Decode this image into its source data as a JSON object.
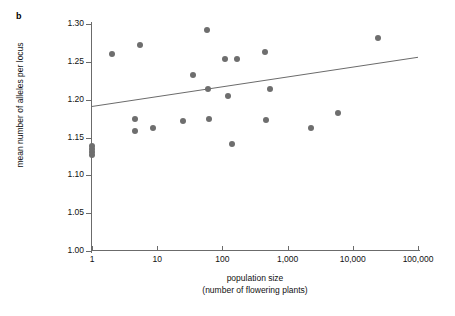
{
  "panel": {
    "label": "b"
  },
  "chart_data": {
    "type": "scatter",
    "title": "",
    "xlabel": "population size",
    "xlabel_line2": "(number of flowering plants)",
    "ylabel": "mean number of alleles per locus",
    "xscale": "log",
    "xlim": [
      1,
      100000
    ],
    "ylim": [
      1.0,
      1.3
    ],
    "grid": false,
    "legend": null,
    "xticks": [
      1,
      10,
      100,
      1000,
      10000,
      100000
    ],
    "xtick_labels": [
      "1",
      "10",
      "100",
      "1,000",
      "10,000",
      "100,000"
    ],
    "yticks": [
      1.0,
      1.05,
      1.1,
      1.15,
      1.2,
      1.25,
      1.3
    ],
    "ytick_labels": [
      "1.00",
      "1.05",
      "1.10",
      "1.15",
      "1.20",
      "1.25",
      "1.30"
    ],
    "point_color": "#6e6e6e",
    "line_color": "#6b6b6b",
    "axis_color": "#6b6b6b",
    "points": [
      {
        "x": 1,
        "y": 1.139
      },
      {
        "x": 1,
        "y": 1.135
      },
      {
        "x": 1,
        "y": 1.131
      },
      {
        "x": 1,
        "y": 1.127
      },
      {
        "x": 2,
        "y": 1.261
      },
      {
        "x": 4.5,
        "y": 1.174
      },
      {
        "x": 4.6,
        "y": 1.159
      },
      {
        "x": 5.5,
        "y": 1.272
      },
      {
        "x": 8.5,
        "y": 1.162
      },
      {
        "x": 25,
        "y": 1.172
      },
      {
        "x": 35,
        "y": 1.233
      },
      {
        "x": 58,
        "y": 1.292
      },
      {
        "x": 60,
        "y": 1.214
      },
      {
        "x": 62,
        "y": 1.174
      },
      {
        "x": 110,
        "y": 1.254
      },
      {
        "x": 120,
        "y": 1.205
      },
      {
        "x": 140,
        "y": 1.141
      },
      {
        "x": 170,
        "y": 1.254
      },
      {
        "x": 450,
        "y": 1.263
      },
      {
        "x": 470,
        "y": 1.173
      },
      {
        "x": 540,
        "y": 1.214
      },
      {
        "x": 2300,
        "y": 1.162
      },
      {
        "x": 6000,
        "y": 1.183
      },
      {
        "x": 24000,
        "y": 1.282
      }
    ],
    "regression_line": {
      "x_start": 1,
      "y_start": 1.191,
      "x_end": 100000,
      "y_end": 1.256
    }
  }
}
